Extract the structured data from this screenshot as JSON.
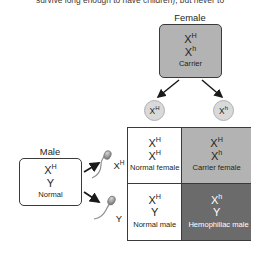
{
  "caption": {
    "text": "survive long enough to have children), but never to"
  },
  "diagram": {
    "type": "punnett-square",
    "topic": "X-linked hemophilia inheritance",
    "parents": {
      "female": {
        "header": "Female",
        "allele1": "X",
        "allele1_sup": "H",
        "allele2": "X",
        "allele2_sup": "h",
        "phenotype": "Carrier"
      },
      "male": {
        "header": "Male",
        "allele1": "X",
        "allele1_sup": "H",
        "allele2": "Y",
        "allele2_sup": "",
        "phenotype": "Normal"
      }
    },
    "gametes": {
      "eggs": [
        {
          "name": "egg-XH",
          "allele": "X",
          "sup": "H"
        },
        {
          "name": "egg-Xh",
          "allele": "X",
          "sup": "h"
        }
      ],
      "sperm": [
        {
          "name": "sperm-XH",
          "allele": "X",
          "sup": "H"
        },
        {
          "name": "sperm-Y",
          "allele": "Y",
          "sup": ""
        }
      ]
    },
    "offspring": [
      {
        "id": "normal-female",
        "allele1": "X",
        "allele1_sup": "H",
        "allele2": "X",
        "allele2_sup": "H",
        "phenotype": "Normal female",
        "fill": "white"
      },
      {
        "id": "carrier-female",
        "allele1": "X",
        "allele1_sup": "H",
        "allele2": "X",
        "allele2_sup": "h",
        "phenotype": "Carrier female",
        "fill": "light-gray"
      },
      {
        "id": "normal-male",
        "allele1": "X",
        "allele1_sup": "H",
        "allele2": "Y",
        "allele2_sup": "",
        "phenotype": "Normal male",
        "fill": "white"
      },
      {
        "id": "hemophiliac-male",
        "allele1": "X",
        "allele1_sup": "h",
        "allele2": "Y",
        "allele2_sup": "",
        "phenotype": "Hemophiliac male",
        "fill": "dark-gray"
      }
    ],
    "colors": {
      "carrier_gray": "#b3b3b3",
      "hemophiliac_gray": "#6b6b6b",
      "border": "#3a3a3a",
      "gamete_gray": "#d9d9d9",
      "text": "#231f20"
    }
  }
}
